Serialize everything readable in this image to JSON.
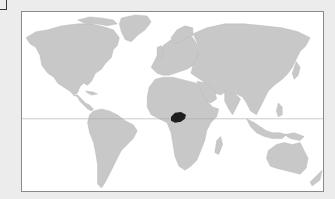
{
  "map": {
    "type": "world-locator-map",
    "projection": "equirectangular",
    "colors": {
      "background": "#ececec",
      "ocean": "#ffffff",
      "land": "#c8c8c8",
      "highlight": "#1e1e1e",
      "equator": "#a9a9a9",
      "border": "#8a8a8a"
    },
    "highlighted_region": {
      "label": "Central Africa",
      "approx_position": "north-central Democratic Republic of the Congo / Central African Republic border area"
    },
    "reference_lines": [
      "equator"
    ]
  }
}
